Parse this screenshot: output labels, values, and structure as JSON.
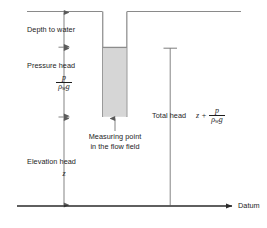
{
  "diagram": {
    "type": "hydraulic-head-piezometer",
    "datum_label": "Datum",
    "labels": {
      "depth_to_water": "Depth to water",
      "pressure_head": "Pressure head",
      "elevation_head": "Elevation head",
      "measuring_point_line1": "Measuring point",
      "measuring_point_line2": "in the flow field",
      "total_head": "Total head"
    },
    "symbols": {
      "elevation": "z",
      "pressure": "p",
      "density": "ρ",
      "density_subscript": "w",
      "gravity": "g",
      "plus": "+"
    },
    "equations": {
      "pressure_head_numerator": "p",
      "pressure_head_denominator_rho": "ρ",
      "pressure_head_denominator_sub": "w",
      "pressure_head_denominator_g": "g",
      "total_head_prefix": "z +"
    },
    "colors": {
      "ink": "#1d1d1d",
      "line": "#6e6e6e",
      "pipe_wall": "#9a9a9a",
      "water_fill": "#d5d5d5",
      "water_surface": "#8c8c8c",
      "datum": "#2a2a2a"
    }
  }
}
